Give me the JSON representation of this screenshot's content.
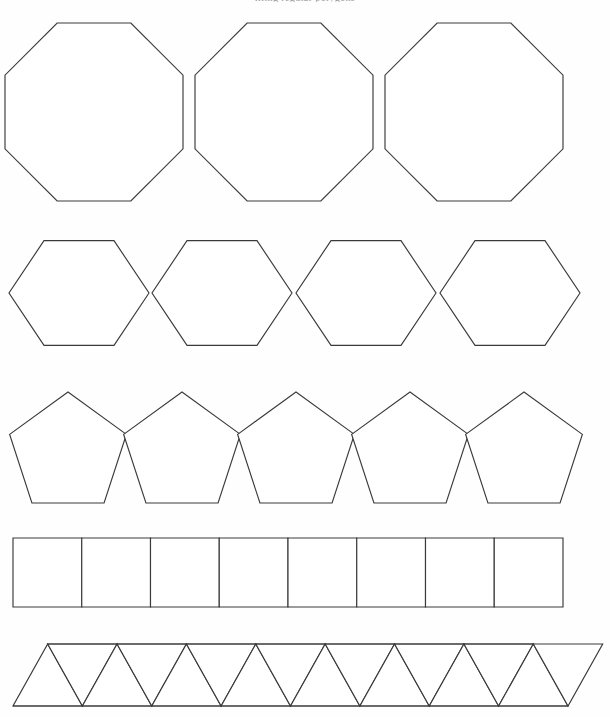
{
  "page": {
    "header_text": "tiling regular polygons",
    "background_color": "#fefefe",
    "stroke_color": "#3a3a3a",
    "fill_color": "#ffffff",
    "width": 610,
    "height": 717
  },
  "rows": [
    {
      "id": "octagon-row",
      "shape": "octagon",
      "shape_label": "Regular octagon",
      "sides": 8,
      "count": 3,
      "arrangement": "horizontal row",
      "top": 24,
      "bottom": 201,
      "size": 178,
      "centers_x": [
        94,
        284,
        474
      ],
      "center_y": 112,
      "radius": 92
    },
    {
      "id": "hexagon-row",
      "shape": "hexagon",
      "shape_label": "Regular hexagon",
      "sides": 6,
      "count": 4,
      "arrangement": "horizontal row",
      "top": 233,
      "bottom": 354,
      "size": 121,
      "centers_x": [
        79,
        222,
        366,
        510
      ],
      "center_y": 293,
      "radius": 70
    },
    {
      "id": "pentagon-row",
      "shape": "pentagon",
      "shape_label": "Regular pentagon",
      "sides": 5,
      "count": 5,
      "arrangement": "horizontal row",
      "top": 392,
      "bottom": 503,
      "size": 111,
      "centers_x": [
        68,
        182,
        296,
        410,
        524
      ],
      "center_y": 452,
      "radius": 60
    },
    {
      "id": "square-row",
      "shape": "square",
      "shape_label": "Square",
      "sides": 4,
      "count": 8,
      "arrangement": "contiguous strip",
      "top": 538,
      "bottom": 607,
      "left": 13,
      "right": 563,
      "cell_width": 68.75,
      "size": 69
    },
    {
      "id": "triangle-row",
      "shape": "triangle",
      "shape_label": "Equilateral triangle",
      "sides": 3,
      "count": 16,
      "arrangement": "alternating strip",
      "top": 644,
      "bottom": 706,
      "left": 13,
      "right": 568,
      "peaks": 8,
      "valleys": 9,
      "cell_width": 34.7,
      "size": 62
    }
  ],
  "summary": {
    "total_rows": 5,
    "row_labels": [
      "octagons",
      "hexagons",
      "pentagons",
      "squares",
      "triangles"
    ],
    "row_counts": [
      3,
      4,
      5,
      8,
      16
    ]
  }
}
